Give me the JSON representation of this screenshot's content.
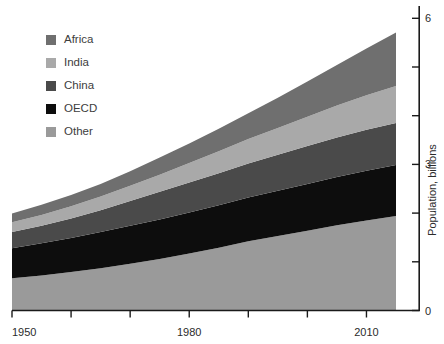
{
  "chart_data": {
    "type": "area",
    "stacked": true,
    "title": "",
    "subtitle": "",
    "xlabel": "",
    "ylabel": "Population, billions",
    "xlim": [
      1950,
      2015
    ],
    "ylim": [
      0,
      7.3
    ],
    "grid": false,
    "legend_position": "top-left",
    "x_ticks_major": [
      1950,
      1980,
      2010
    ],
    "x_ticks_minor": [
      1960,
      1970,
      1990,
      2000
    ],
    "x_tick_labels": [
      "1950",
      "1980",
      "2010"
    ],
    "y_ticks_major": [
      0,
      3,
      6
    ],
    "y_ticks_minor": [
      1,
      2,
      4,
      5,
      7
    ],
    "y_tick_labels": [
      "0",
      "3",
      "6"
    ],
    "x": [
      1950,
      1955,
      1960,
      1965,
      1970,
      1975,
      1980,
      1985,
      1990,
      1995,
      2000,
      2005,
      2010,
      2015
    ],
    "stack_order_bottom_to_top": [
      "Other",
      "OECD",
      "China",
      "India",
      "Africa"
    ],
    "series": [
      {
        "name": "Other",
        "color": "#9a9a9a",
        "values": [
          0.66,
          0.72,
          0.79,
          0.87,
          0.96,
          1.06,
          1.17,
          1.29,
          1.42,
          1.53,
          1.64,
          1.75,
          1.85,
          1.94
        ]
      },
      {
        "name": "OECD",
        "color": "#0d0d0d",
        "values": [
          0.62,
          0.66,
          0.7,
          0.74,
          0.78,
          0.81,
          0.84,
          0.87,
          0.9,
          0.93,
          0.96,
          0.99,
          1.02,
          1.05
        ]
      },
      {
        "name": "China",
        "color": "#4a4a4a",
        "values": [
          0.33,
          0.36,
          0.4,
          0.45,
          0.51,
          0.57,
          0.62,
          0.66,
          0.7,
          0.74,
          0.78,
          0.81,
          0.84,
          0.86
        ]
      },
      {
        "name": "India",
        "color": "#a9a9a9",
        "values": [
          0.2,
          0.22,
          0.25,
          0.28,
          0.31,
          0.35,
          0.4,
          0.45,
          0.5,
          0.55,
          0.6,
          0.66,
          0.71,
          0.76
        ]
      },
      {
        "name": "Africa",
        "color": "#6f6f6f",
        "values": [
          0.18,
          0.21,
          0.23,
          0.26,
          0.3,
          0.35,
          0.4,
          0.46,
          0.53,
          0.62,
          0.72,
          0.83,
          0.96,
          1.1
        ]
      }
    ]
  },
  "legend": {
    "items": [
      {
        "label": "Africa",
        "color": "#6f6f6f"
      },
      {
        "label": "India",
        "color": "#a9a9a9"
      },
      {
        "label": "China",
        "color": "#4a4a4a"
      },
      {
        "label": "OECD",
        "color": "#0d0d0d"
      },
      {
        "label": "Other",
        "color": "#9a9a9a"
      }
    ]
  },
  "axes": {
    "y_title": "Population, billions",
    "y_labels": [
      "6",
      "3",
      "0"
    ],
    "x_labels": [
      "1950",
      "1980",
      "2010"
    ]
  },
  "colors": {
    "background": "#ffffff",
    "axis": "#1a1a1a",
    "text": "#2b2b2b",
    "legend_text": "#3d3d3d"
  }
}
